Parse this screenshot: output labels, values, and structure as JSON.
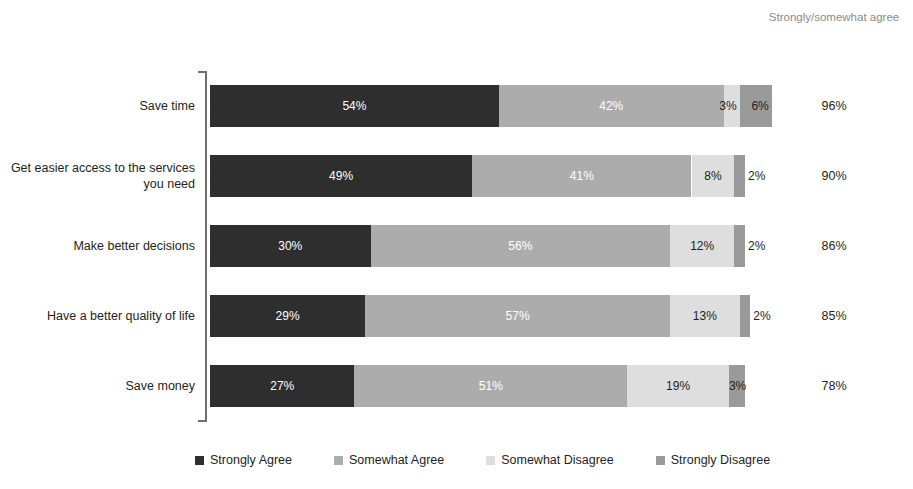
{
  "header": {
    "right_column_title": "Strongly/somewhat agree"
  },
  "colors": {
    "strongly_agree": "#2e2e2e",
    "somewhat_agree": "#acacac",
    "somewhat_disagree": "#dedede",
    "strongly_disagree": "#9a9a9a",
    "axis": "#6f6f6f",
    "header_text": "#8a8a8a",
    "text": "#231f20",
    "label_on_dark": "#ffffff",
    "background": "#ffffff"
  },
  "chart_data": {
    "type": "bar",
    "subtype": "stacked-horizontal",
    "title": "",
    "xlabel": "",
    "ylabel": "",
    "xlim": [
      0,
      100
    ],
    "grid": false,
    "legend_position": "bottom",
    "categories": [
      "Save time",
      "Get easier access to the services you need",
      "Make better decisions",
      "Have a better quality of life",
      "Save money"
    ],
    "series": [
      {
        "name": "Strongly Agree",
        "values": [
          54,
          49,
          30,
          29,
          27
        ]
      },
      {
        "name": "Somewhat Agree",
        "values": [
          42,
          41,
          56,
          57,
          51
        ]
      },
      {
        "name": "Somewhat Disagree",
        "values": [
          3,
          8,
          12,
          13,
          19
        ]
      },
      {
        "name": "Strongly Disagree",
        "values": [
          6,
          2,
          2,
          2,
          3
        ]
      }
    ],
    "annotations": {
      "right_column_label": "Strongly/somewhat agree",
      "right_column_values": [
        "96%",
        "90%",
        "86%",
        "85%",
        "78%"
      ]
    }
  },
  "rows": [
    {
      "label": "Save time",
      "total": "96%",
      "segments": [
        {
          "key": "strongly_agree",
          "value": 54,
          "label": "54%",
          "label_placement": "inside-center",
          "label_color": "#ffffff"
        },
        {
          "key": "somewhat_agree",
          "value": 42,
          "label": "42%",
          "label_placement": "inside-center",
          "label_color": "#ffffff"
        },
        {
          "key": "somewhat_disagree",
          "value": 3,
          "label": "3%",
          "label_placement": "over-right",
          "label_color": "#231f20"
        },
        {
          "key": "strongly_disagree",
          "value": 6,
          "label": "6%",
          "label_placement": "over-right",
          "label_color": "#231f20"
        }
      ]
    },
    {
      "label": "Get easier access to the services you need",
      "total": "90%",
      "segments": [
        {
          "key": "strongly_agree",
          "value": 49,
          "label": "49%",
          "label_placement": "inside-center",
          "label_color": "#ffffff"
        },
        {
          "key": "somewhat_agree",
          "value": 41,
          "label": "41%",
          "label_placement": "inside-center",
          "label_color": "#ffffff"
        },
        {
          "key": "somewhat_disagree",
          "value": 8,
          "label": "8%",
          "label_placement": "inside-center",
          "label_color": "#231f20"
        },
        {
          "key": "strongly_disagree",
          "value": 2,
          "label": "2%",
          "label_placement": "outside-right",
          "label_color": "#231f20"
        }
      ]
    },
    {
      "label": "Make better decisions",
      "total": "86%",
      "segments": [
        {
          "key": "strongly_agree",
          "value": 30,
          "label": "30%",
          "label_placement": "inside-center",
          "label_color": "#ffffff"
        },
        {
          "key": "somewhat_agree",
          "value": 56,
          "label": "56%",
          "label_placement": "inside-center",
          "label_color": "#ffffff"
        },
        {
          "key": "somewhat_disagree",
          "value": 12,
          "label": "12%",
          "label_placement": "inside-center",
          "label_color": "#231f20"
        },
        {
          "key": "strongly_disagree",
          "value": 2,
          "label": "2%",
          "label_placement": "outside-right",
          "label_color": "#231f20"
        }
      ]
    },
    {
      "label": "Have a better quality of life",
      "total": "85%",
      "segments": [
        {
          "key": "strongly_agree",
          "value": 29,
          "label": "29%",
          "label_placement": "inside-center",
          "label_color": "#ffffff"
        },
        {
          "key": "somewhat_agree",
          "value": 57,
          "label": "57%",
          "label_placement": "inside-center",
          "label_color": "#ffffff"
        },
        {
          "key": "somewhat_disagree",
          "value": 13,
          "label": "13%",
          "label_placement": "inside-center",
          "label_color": "#231f20"
        },
        {
          "key": "strongly_disagree",
          "value": 2,
          "label": "2%",
          "label_placement": "outside-right",
          "label_color": "#231f20"
        }
      ]
    },
    {
      "label": "Save money",
      "total": "78%",
      "segments": [
        {
          "key": "strongly_agree",
          "value": 27,
          "label": "27%",
          "label_placement": "inside-center",
          "label_color": "#ffffff"
        },
        {
          "key": "somewhat_agree",
          "value": 51,
          "label": "51%",
          "label_placement": "inside-center",
          "label_color": "#ffffff"
        },
        {
          "key": "somewhat_disagree",
          "value": 19,
          "label": "19%",
          "label_placement": "inside-center",
          "label_color": "#231f20"
        },
        {
          "key": "strongly_disagree",
          "value": 3,
          "label": "3%",
          "label_placement": "inside-center",
          "label_color": "#231f20"
        }
      ]
    }
  ],
  "legend": {
    "items": [
      {
        "key": "strongly_agree",
        "label": "Strongly Agree"
      },
      {
        "key": "somewhat_agree",
        "label": "Somewhat Agree"
      },
      {
        "key": "somewhat_disagree",
        "label": "Somewhat Disagree"
      },
      {
        "key": "strongly_disagree",
        "label": "Strongly Disagree"
      }
    ]
  }
}
